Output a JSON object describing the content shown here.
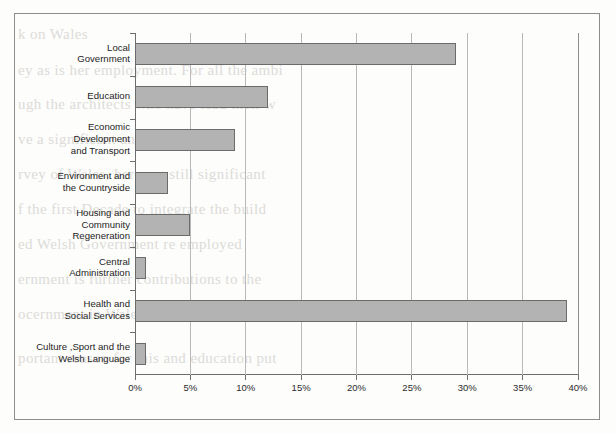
{
  "figure": {
    "frame_color": "#8d8d8d",
    "background_color": "#fdfdfc"
  },
  "chart_data": {
    "type": "bar",
    "orientation": "horizontal",
    "title": "",
    "subtitle": "",
    "xlabel": "",
    "ylabel": "",
    "xlim": [
      0,
      40
    ],
    "xtick_labels": [
      "0%",
      "5%",
      "10%",
      "15%",
      "20%",
      "25%",
      "30%",
      "35%",
      "40%"
    ],
    "xtick_values": [
      0,
      5,
      10,
      15,
      20,
      25,
      30,
      35,
      40
    ],
    "grid": "vertical",
    "legend": "none",
    "unit": "%",
    "bar_fill_color": "#b3b3b3",
    "bar_edge_color": "#6b6b6b",
    "gridline_color": "#b9b9b9",
    "axis_color": "#6e6e6e",
    "categories": [
      "Local\nGovernment",
      "Education",
      "Economic\nDevelopment\nand Transport",
      "Environment and\nthe Countryside",
      "Housing and\nCommunity\nRegeneration",
      "Central\nAdministration",
      "Health and\nSocial Services",
      "Culture ,Sport and the\nWelsh Language"
    ],
    "values": [
      29,
      12,
      9,
      3,
      5,
      1,
      39,
      1
    ]
  },
  "background_text": [
    "k on Wales",
    "ey as is her employment. For all the ambi",
    "ugh the architects who have lead their w",
    "ve a significant and long lasting",
    "rvey of Wales, here are still significant",
    "f the first Decade to integrate the build",
    "ed Welsh Government re employed",
    "ernment is further contributions to the",
    "ocernment in Wales and were we Europe",
    "portant reason for this and education put"
  ]
}
